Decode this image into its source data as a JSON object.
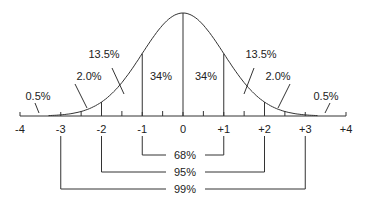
{
  "chart_data": {
    "type": "area",
    "title": "",
    "xlabel": "",
    "ylabel": "",
    "x_ticks": [
      "-4",
      "-3",
      "-2",
      "-1",
      "0",
      "+1",
      "+2",
      "+3",
      "+4"
    ],
    "xlim": [
      -4,
      4
    ],
    "grid": false,
    "bands": [
      {
        "range": [
          -4,
          -3
        ],
        "label": "0.5%",
        "value": 0.5
      },
      {
        "range": [
          -3,
          -2
        ],
        "label": "2.0%",
        "value": 2.0
      },
      {
        "range": [
          -2,
          -1
        ],
        "label": "13.5%",
        "value": 13.5
      },
      {
        "range": [
          -1,
          0
        ],
        "label": "34%",
        "value": 34
      },
      {
        "range": [
          0,
          1
        ],
        "label": "34%",
        "value": 34
      },
      {
        "range": [
          1,
          2
        ],
        "label": "13.5%",
        "value": 13.5
      },
      {
        "range": [
          2,
          3
        ],
        "label": "2.0%",
        "value": 2.0
      },
      {
        "range": [
          3,
          4
        ],
        "label": "0.5%",
        "value": 0.5
      }
    ],
    "brackets": [
      {
        "range": [
          -1,
          1
        ],
        "label": "68%",
        "value": 68
      },
      {
        "range": [
          -2,
          2
        ],
        "label": "95%",
        "value": 95
      },
      {
        "range": [
          -3,
          3
        ],
        "label": "99%",
        "value": 99
      }
    ]
  }
}
